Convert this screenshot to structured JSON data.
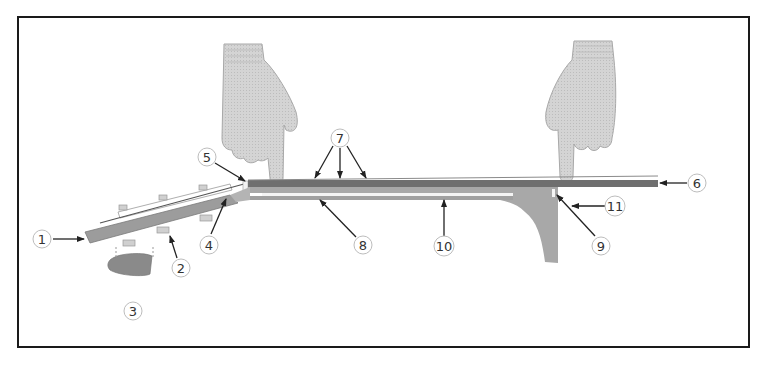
{
  "diagram": {
    "type": "guitar-neck-relief-check",
    "colors": {
      "frame": "#1a1a1a",
      "neck_dark": "#6f6f6f",
      "neck_mid": "#9c9c9c",
      "neck_light": "#c4c4c4",
      "hand_fill": "#d6d6d6",
      "hand_stroke": "#a8a8a8",
      "arrow": "#222222",
      "label_circle": "#bdbdbd"
    },
    "labels": [
      {
        "id": "1",
        "text": "1",
        "x": 42,
        "y": 239
      },
      {
        "id": "2",
        "text": "2",
        "x": 181,
        "y": 268
      },
      {
        "id": "3",
        "text": "3",
        "x": 133,
        "y": 311
      },
      {
        "id": "4",
        "text": "4",
        "x": 209,
        "y": 245
      },
      {
        "id": "5",
        "text": "5",
        "x": 207,
        "y": 157
      },
      {
        "id": "6",
        "text": "6",
        "x": 697,
        "y": 183
      },
      {
        "id": "7",
        "text": "7",
        "x": 340,
        "y": 138
      },
      {
        "id": "8",
        "text": "8",
        "x": 363,
        "y": 245
      },
      {
        "id": "9",
        "text": "9",
        "x": 601,
        "y": 246
      },
      {
        "id": "10",
        "text": "10",
        "x": 444,
        "y": 246
      },
      {
        "id": "11",
        "text": "11",
        "x": 615,
        "y": 206
      }
    ]
  }
}
